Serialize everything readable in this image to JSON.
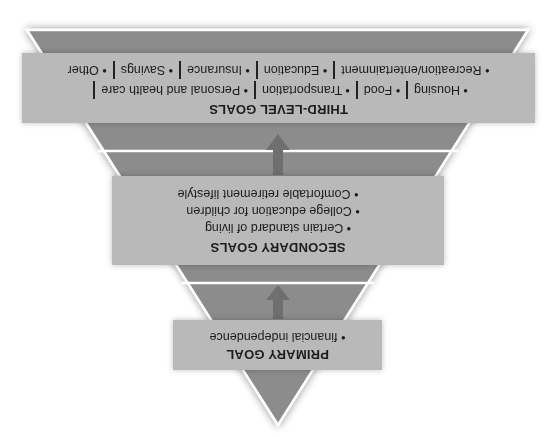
{
  "diagram": {
    "orientation": "rotated-180",
    "shape": "inverted-pyramid",
    "colors": {
      "band": "#8c8c8c",
      "box": "#b9b9b9",
      "arrow": "#6f6f6f",
      "outline": "#ffffff",
      "text": "#1c1c1c"
    },
    "primary": {
      "title": "PRIMARY GOAL",
      "items": [
        "• financial independence"
      ]
    },
    "secondary": {
      "title": "SECONDARY GOALS",
      "items": [
        "• Certain standard of living",
        "• College education for children",
        "• Comfortable retirement lifestyle"
      ]
    },
    "third": {
      "title": "THIRD-LEVEL GOALS",
      "row1": [
        "• Housing",
        "• Food",
        "• Transportation",
        "• Personal and health care"
      ],
      "row2": [
        "• Recreation/entertainment",
        "• Education",
        "• Insurance",
        "• Savings",
        "• Other"
      ]
    },
    "arrows": [
      "arrow-down-icon",
      "arrow-down-icon"
    ]
  }
}
